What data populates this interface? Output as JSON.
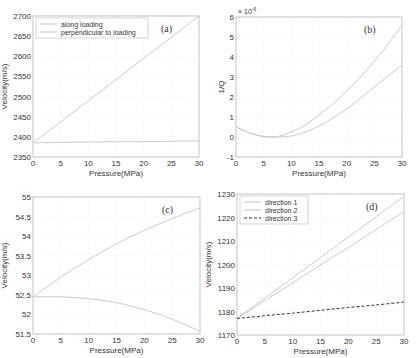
{
  "chart_data": [
    {
      "id": "a",
      "type": "line",
      "panel_label": "(a)",
      "xlabel": "Pressure(MPa)",
      "ylabel": "Velocity(m/s)",
      "xlim": [
        0,
        30
      ],
      "ylim": [
        2350,
        2700
      ],
      "xticks": [
        0,
        5,
        10,
        15,
        20,
        25,
        30
      ],
      "yticks": [
        2350,
        2400,
        2450,
        2500,
        2550,
        2600,
        2650,
        2700
      ],
      "grid": true,
      "legend_position": "upper left",
      "x": [
        0,
        5,
        10,
        15,
        20,
        25,
        30
      ],
      "series": [
        {
          "name": "along loading",
          "style": "solid",
          "values": [
            2385,
            2437,
            2490,
            2542,
            2595,
            2647,
            2700
          ]
        },
        {
          "name": "perpendicular to loading",
          "style": "solid",
          "values": [
            2385,
            2386,
            2387,
            2388,
            2388,
            2389,
            2390
          ]
        }
      ]
    },
    {
      "id": "b",
      "type": "line",
      "panel_label": "(b)",
      "xlabel": "Pressure(MPa)",
      "ylabel": "1/Q",
      "y_multiplier": "× 10^-6",
      "xlim": [
        0,
        30
      ],
      "ylim": [
        -1,
        6
      ],
      "xticks": [
        0,
        5,
        10,
        15,
        20,
        25,
        30
      ],
      "yticks": [
        -1,
        0,
        1,
        2,
        3,
        4,
        5,
        6
      ],
      "grid": true,
      "x": [
        0,
        2.5,
        5,
        7.5,
        10,
        12.5,
        15,
        17.5,
        20,
        22.5,
        25,
        27.5,
        30
      ],
      "series": [
        {
          "name": "curve 1",
          "style": "solid",
          "values": [
            0.5,
            0.2,
            0.02,
            0.02,
            0.25,
            0.6,
            1.1,
            1.65,
            2.3,
            3.0,
            3.8,
            4.65,
            5.6
          ]
        },
        {
          "name": "curve 2",
          "style": "solid",
          "values": [
            0.5,
            0.2,
            0.03,
            0.0,
            0.05,
            0.25,
            0.55,
            0.95,
            1.4,
            1.95,
            2.5,
            3.05,
            3.6
          ]
        }
      ]
    },
    {
      "id": "c",
      "type": "line",
      "panel_label": "(c)",
      "xlabel": "Pressure(MPa)",
      "ylabel": "Velocity(m/s)",
      "xlim": [
        0,
        30
      ],
      "ylim": [
        51.5,
        55
      ],
      "xticks": [
        0,
        5,
        10,
        15,
        20,
        25,
        30
      ],
      "yticks": [
        51.5,
        52,
        52.5,
        53,
        53.5,
        54,
        54.5,
        55
      ],
      "grid": true,
      "x": [
        0,
        5,
        10,
        15,
        20,
        25,
        30
      ],
      "series": [
        {
          "name": "curve 1",
          "style": "solid",
          "values": [
            52.45,
            52.95,
            53.4,
            53.8,
            54.15,
            54.45,
            54.72
          ]
        },
        {
          "name": "curve 2",
          "style": "solid",
          "values": [
            52.45,
            52.45,
            52.4,
            52.3,
            52.12,
            51.88,
            51.57
          ]
        }
      ]
    },
    {
      "id": "d",
      "type": "line",
      "panel_label": "(d)",
      "xlabel": "Pressure(MPa)",
      "ylabel": "Velocity(m/s)",
      "xlim": [
        0,
        30
      ],
      "ylim": [
        1170,
        1230
      ],
      "xticks": [
        0,
        5,
        10,
        15,
        20,
        25,
        30
      ],
      "yticks": [
        1170,
        1180,
        1190,
        1200,
        1210,
        1220,
        1230
      ],
      "grid": true,
      "legend_position": "upper left",
      "x": [
        0,
        5,
        10,
        15,
        20,
        25,
        30
      ],
      "series": [
        {
          "name": "direction 1",
          "style": "solid",
          "values": [
            1177,
            1185.7,
            1194.3,
            1203,
            1211.7,
            1220.3,
            1229
          ]
        },
        {
          "name": "direction 2",
          "style": "solid",
          "values": [
            1177,
            1184.6,
            1192.2,
            1199.8,
            1207.3,
            1214.9,
            1222.5
          ]
        },
        {
          "name": "direction 3",
          "style": "dashed",
          "values": [
            1177,
            1178.2,
            1179.3,
            1180.5,
            1181.7,
            1182.8,
            1184
          ]
        }
      ]
    }
  ],
  "layout": [
    {
      "left": 33,
      "top": 16,
      "right": 199,
      "bottom": 157
    },
    {
      "left": 236,
      "top": 17,
      "right": 402,
      "bottom": 157
    },
    {
      "left": 33,
      "top": 197,
      "right": 200,
      "bottom": 334
    },
    {
      "left": 237,
      "top": 194,
      "right": 404,
      "bottom": 335
    }
  ],
  "colors": {
    "axis": "#b8b8b8",
    "grid": "#e6e6e6",
    "line": "#c4c4c4",
    "dashed": "#333333",
    "text": "#333333"
  }
}
